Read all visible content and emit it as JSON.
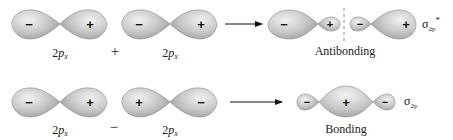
{
  "colors": {
    "lobe_light": "#ececec",
    "lobe_mid": "#c4c4c4",
    "lobe_dark": "#9a9a9a",
    "lobe_stroke": "#8c8c8c",
    "text": "#222222",
    "arrow": "#111111",
    "node_line": "#888888"
  },
  "rows": [
    {
      "name": "antibonding-row",
      "operator": "+",
      "orbitals": [
        {
          "label_main": "2",
          "label_italic": "p",
          "label_sub": "x",
          "left_sign": "−",
          "right_sign": "+"
        },
        {
          "label_main": "2",
          "label_italic": "p",
          "label_sub": "x",
          "left_sign": "−",
          "right_sign": "+"
        }
      ],
      "result": {
        "caption": "Antibonding",
        "signs": [
          "−",
          "+",
          "−",
          "+"
        ],
        "symbol": "σ",
        "symbol_sub": "2p",
        "symbol_sup": "*"
      }
    },
    {
      "name": "bonding-row",
      "operator": "−",
      "orbitals": [
        {
          "label_main": "2",
          "label_italic": "p",
          "label_sub": "x",
          "left_sign": "−",
          "right_sign": "+"
        },
        {
          "label_main": "2",
          "label_italic": "p",
          "label_sub": "x",
          "left_sign": "+",
          "right_sign": "−"
        }
      ],
      "result": {
        "caption": "Bonding",
        "signs": [
          "−",
          "+",
          "−"
        ],
        "symbol": "σ",
        "symbol_sub": "2p",
        "symbol_sup": ""
      }
    }
  ]
}
